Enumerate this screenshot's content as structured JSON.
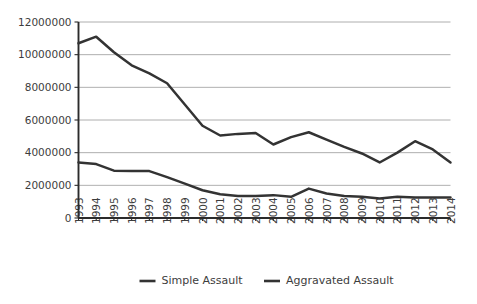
{
  "chart_data": {
    "type": "line",
    "title": "",
    "subtitle": "",
    "xlabel": "",
    "ylabel": "",
    "grid": true,
    "legend_position": "bottom",
    "xlim": [
      1993,
      2014
    ],
    "ylim": [
      0,
      12000000
    ],
    "ytick_labels": [
      "12000000",
      "10000000",
      "8000000",
      "6000000",
      "4000000",
      "2000000",
      "0"
    ],
    "ytick_values": [
      12000000,
      10000000,
      8000000,
      6000000,
      4000000,
      2000000,
      0
    ],
    "categories": [
      "1993",
      "1994",
      "1995",
      "1996",
      "1997",
      "1998",
      "1999",
      "2000",
      "2001",
      "2002",
      "2003",
      "2004",
      "2005",
      "2006",
      "2007",
      "2008",
      "2009",
      "2010",
      "2011",
      "2012",
      "2013",
      "2014"
    ],
    "series": [
      {
        "name": "Simple Assault",
        "color": "#333333",
        "values": [
          10700000,
          11100000,
          10150000,
          9350000,
          8850000,
          8250000,
          6950000,
          5650000,
          5050000,
          5150000,
          5200000,
          4500000,
          4950000,
          5250000,
          4800000,
          4350000,
          3950000,
          3400000,
          4000000,
          4700000,
          4200000,
          3400000
        ]
      },
      {
        "name": "Aggravated Assault",
        "color": "#333333",
        "values": [
          3400000,
          3300000,
          2900000,
          2870000,
          2870000,
          2500000,
          2100000,
          1700000,
          1450000,
          1350000,
          1350000,
          1400000,
          1300000,
          1800000,
          1500000,
          1350000,
          1300000,
          1200000,
          1300000,
          1250000,
          1250000,
          1250000
        ]
      }
    ],
    "legend": [
      {
        "label": "Simple Assault",
        "color": "#333333"
      },
      {
        "label": "Aggravated Assault",
        "color": "#333333"
      }
    ]
  }
}
